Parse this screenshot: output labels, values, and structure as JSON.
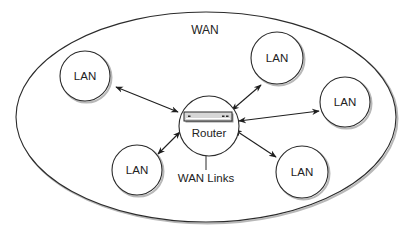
{
  "diagram": {
    "title": "WAN",
    "colors": {
      "stroke": "#2b2b2b",
      "shadow": "#b8b8b8",
      "text": "#222222",
      "router_body": "#d6d6d6",
      "background": "#ffffff"
    },
    "wan_boundary": {
      "label": "WAN",
      "cx": 206,
      "cy": 117,
      "rx": 190,
      "ry": 105
    },
    "router": {
      "label": "Router",
      "cx": 209,
      "cy": 126,
      "r": 30,
      "device": {
        "x": 184,
        "y": 112,
        "w": 48,
        "h": 9
      }
    },
    "wan_links_label": {
      "label": "WAN Links",
      "line": {
        "x": 206,
        "y1": 155,
        "y2": 170
      },
      "x": 206,
      "y": 178
    },
    "lans": [
      {
        "id": "lan-top-left",
        "label": "LAN",
        "cx": 85,
        "cy": 76,
        "r": 25
      },
      {
        "id": "lan-top-right",
        "label": "LAN",
        "cx": 277,
        "cy": 58,
        "r": 26
      },
      {
        "id": "lan-right",
        "label": "LAN",
        "cx": 345,
        "cy": 102,
        "r": 25
      },
      {
        "id": "lan-bottom-left",
        "label": "LAN",
        "cx": 137,
        "cy": 170,
        "r": 25
      },
      {
        "id": "lan-bottom-right",
        "label": "LAN",
        "cx": 302,
        "cy": 172,
        "r": 26
      }
    ],
    "links": [
      {
        "from": "lan-top-left",
        "to": "router",
        "x1": 116,
        "y1": 87,
        "x2": 178,
        "y2": 112
      },
      {
        "from": "lan-top-right",
        "to": "router",
        "x1": 261,
        "y1": 85,
        "x2": 232,
        "y2": 110
      },
      {
        "from": "lan-right",
        "to": "router",
        "x1": 319,
        "y1": 111,
        "x2": 239,
        "y2": 121
      },
      {
        "from": "lan-bottom-left",
        "to": "router",
        "x1": 158,
        "y1": 154,
        "x2": 180,
        "y2": 132
      },
      {
        "from": "lan-bottom-right",
        "to": "router",
        "x1": 276,
        "y1": 157,
        "x2": 235,
        "y2": 130
      }
    ]
  }
}
